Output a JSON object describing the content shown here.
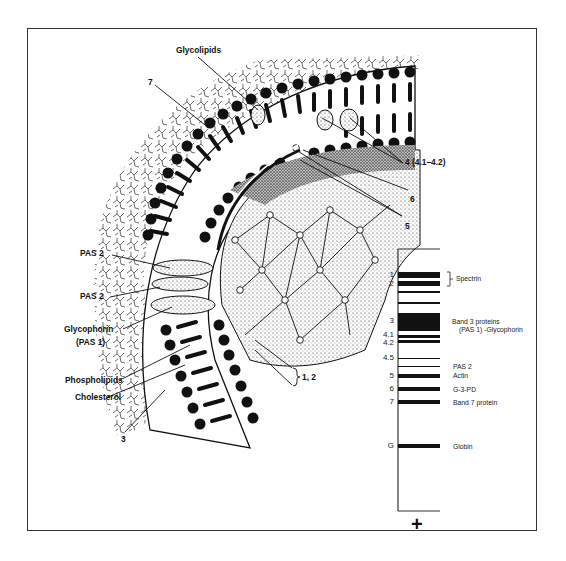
{
  "figure": {
    "type": "red blood cell membrane cross-section with SDS-PAGE band pattern"
  },
  "membrane_labels": {
    "glycolipids": "Glycolipids",
    "seven": "7",
    "four": "4 (4.1–4.2)",
    "six": "6",
    "five": "5",
    "pas2_upper": "PAS 2",
    "pas2_lower": "PAS 2",
    "glycophorin": "Glycophorin",
    "pas1": "(PAS 1)",
    "phospholipids": "Phospholipids",
    "cholesterol": "Cholesterol",
    "three": "3",
    "one_two": "1, 2"
  },
  "gel": {
    "polarity_symbol": "+",
    "bands": [
      {
        "num": "1",
        "name": "Spectrin",
        "y": 272,
        "h": 6
      },
      {
        "num": "2",
        "name": "",
        "y": 281,
        "h": 5
      },
      {
        "num": "",
        "name": "",
        "y": 291,
        "h": 2
      },
      {
        "num": "",
        "name": "",
        "y": 302,
        "h": 2
      },
      {
        "num": "3",
        "name": "Band 3 proteins",
        "y": 313,
        "h": 18
      },
      {
        "num": "4.1",
        "name": "",
        "y": 335,
        "h": 3
      },
      {
        "num": "4.2",
        "name": "",
        "y": 340,
        "h": 3
      },
      {
        "num": "4.5",
        "name": "",
        "y": 358,
        "h": 1
      },
      {
        "num": "",
        "name": "PAS 2",
        "y": 366,
        "h": 1
      },
      {
        "num": "5",
        "name": "Actin",
        "y": 374,
        "h": 4
      },
      {
        "num": "6",
        "name": "G-3-PD",
        "y": 387,
        "h": 4
      },
      {
        "num": "7",
        "name": "Band 7 protein",
        "y": 400,
        "h": 4
      },
      {
        "num": "G",
        "name": "Globin",
        "y": 444,
        "h": 4
      }
    ],
    "labels": {
      "spectrin": "Spectrin",
      "band3_line1": "Band 3 proteins",
      "band3_line2": "(PAS 1) -Glycophorin",
      "pas2": "PAS 2",
      "actin": "Actin",
      "g3pd": "G-3-PD",
      "band7": "Band 7 protein",
      "globin": "Globin"
    },
    "numbers": {
      "n1": "1",
      "n2": "2",
      "n3": "3",
      "n41": "4.1",
      "n42": "4.2",
      "n45": "4.5",
      "n5": "5",
      "n6": "6",
      "n7": "7",
      "nG": "G"
    }
  }
}
